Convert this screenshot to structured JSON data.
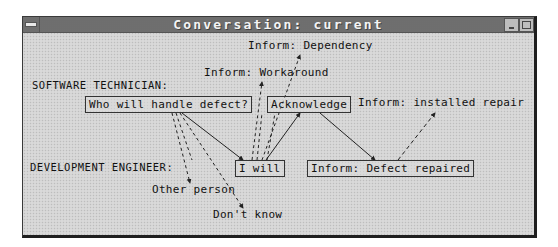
{
  "window": {
    "title": "Conversation: current",
    "controls": {
      "system_menu_icon": "system-menu-bar",
      "minimize_icon": "minimize-triangle",
      "maximize_icon": "maximize-square"
    }
  },
  "roles": {
    "software_technician": "SOFTWARE TECHNICIAN:",
    "development_engineer": "DEVELOPMENT ENGINEER:"
  },
  "nodes": {
    "who_will_handle": {
      "label": "Who will handle defect?",
      "role": "software_technician",
      "type": "selected"
    },
    "acknowledge": {
      "label": "Acknowledge",
      "role": "software_technician",
      "type": "selected"
    },
    "i_will": {
      "label": "I will",
      "role": "development_engineer",
      "type": "selected"
    },
    "defect_repaired": {
      "label": "Inform: Defect repaired",
      "role": "development_engineer",
      "type": "selected"
    },
    "inform_dependency": {
      "label": "Inform: Dependency",
      "type": "alternative"
    },
    "inform_workaround": {
      "label": "Inform: Workaround",
      "type": "alternative"
    },
    "inform_installed_repair": {
      "label": "Inform: installed repair",
      "type": "alternative"
    },
    "other_person": {
      "label": "Other person",
      "type": "alternative"
    },
    "dont_know": {
      "label": "Don't know",
      "type": "alternative"
    }
  },
  "edges": [
    {
      "from": "who_will_handle",
      "to": "i_will",
      "style": "solid"
    },
    {
      "from": "i_will",
      "to": "acknowledge",
      "style": "solid"
    },
    {
      "from": "acknowledge",
      "to": "defect_repaired",
      "style": "solid"
    },
    {
      "from": "who_will_handle",
      "to": "other_person",
      "style": "dashed"
    },
    {
      "from": "who_will_handle",
      "to": "dont_know",
      "style": "dashed"
    },
    {
      "from": "i_will",
      "to": "inform_workaround",
      "style": "dashed"
    },
    {
      "from": "i_will",
      "to": "inform_dependency",
      "style": "dashed"
    },
    {
      "from": "defect_repaired",
      "to": "inform_installed_repair",
      "style": "dashed"
    }
  ],
  "colors": {
    "background": "#d4d4d4",
    "titlebar": "#8c8c8c",
    "text": "#111111",
    "line": "#222222"
  }
}
